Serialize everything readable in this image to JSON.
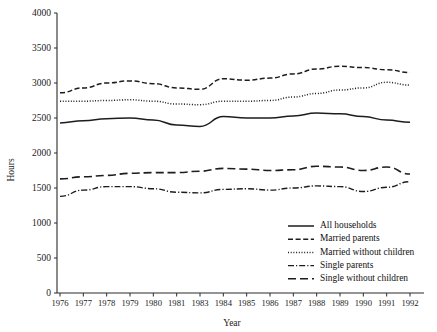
{
  "chart_data": {
    "type": "line",
    "title": "",
    "xlabel": "Year",
    "ylabel": "Hours",
    "ylim": [
      0,
      4000
    ],
    "yticks": [
      0,
      500,
      1000,
      1500,
      2000,
      2500,
      3000,
      3500,
      4000
    ],
    "grid": false,
    "legend_position": "bottom-right",
    "categories": [
      "1976",
      "1977",
      "1978",
      "1979",
      "1980",
      "1981",
      "1983",
      "1984",
      "1985",
      "1986",
      "1987",
      "1988",
      "1989",
      "1990",
      "1991",
      "1992"
    ],
    "series": [
      {
        "name": "All households",
        "style": "solid",
        "dash": "0",
        "width": 1.5,
        "values": [
          2430,
          2460,
          2490,
          2500,
          2470,
          2400,
          2380,
          2520,
          2500,
          2500,
          2530,
          2570,
          2560,
          2520,
          2470,
          2440
        ]
      },
      {
        "name": "Married parents",
        "style": "dashed-short",
        "dash": "5,2.6",
        "width": 1.5,
        "values": [
          2860,
          2930,
          3000,
          3030,
          2990,
          2930,
          2910,
          3060,
          3040,
          3070,
          3130,
          3200,
          3240,
          3220,
          3190,
          3150
        ]
      },
      {
        "name": "Married without children",
        "style": "dotted",
        "dash": "1,1.7",
        "width": 1.5,
        "values": [
          2740,
          2740,
          2750,
          2760,
          2740,
          2700,
          2690,
          2740,
          2740,
          2750,
          2800,
          2850,
          2900,
          2930,
          3010,
          2970
        ]
      },
      {
        "name": "Single parents",
        "style": "dash-dot",
        "dash": "6,2,1.2,2",
        "width": 1.4,
        "values": [
          1380,
          1470,
          1520,
          1520,
          1490,
          1440,
          1430,
          1480,
          1490,
          1470,
          1500,
          1530,
          1520,
          1450,
          1510,
          1590
        ]
      },
      {
        "name": "Single without children",
        "style": "dashed-long",
        "dash": "8,4",
        "width": 1.6,
        "values": [
          1630,
          1660,
          1680,
          1710,
          1720,
          1720,
          1740,
          1780,
          1770,
          1750,
          1760,
          1810,
          1800,
          1750,
          1800,
          1700
        ]
      }
    ]
  },
  "legend": {
    "items": [
      {
        "label": "All households"
      },
      {
        "label": "Married parents"
      },
      {
        "label": "Married without children"
      },
      {
        "label": "Single parents"
      },
      {
        "label": "Single without children"
      }
    ]
  }
}
